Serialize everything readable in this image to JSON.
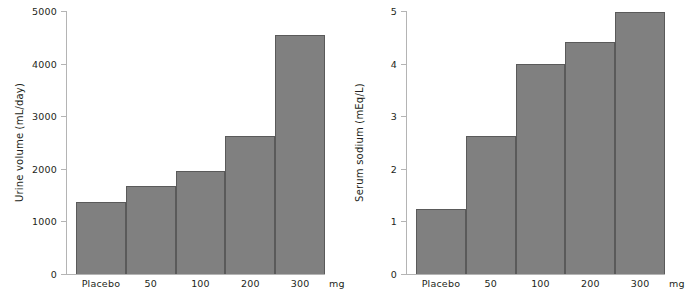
{
  "figure": {
    "background": "#ffffff",
    "bar_fill": "#808080",
    "bar_stroke": "#5a5a5a",
    "axis_color": "#b4b4b4",
    "text_color": "#231f20"
  },
  "panels": [
    {
      "id": "urine-volume",
      "ylabel": "Urine volume (mL/day)",
      "unit_label": "mg",
      "yticks": [
        "0",
        "1000",
        "2000",
        "3000",
        "4000",
        "5000"
      ],
      "categories": [
        "Placebo",
        "50",
        "100",
        "200",
        "300"
      ],
      "values": [
        1370,
        1670,
        1960,
        2620,
        4550
      ]
    },
    {
      "id": "serum-sodium",
      "ylabel": "Serum sodium (mEq/L)",
      "unit_label": "mg",
      "yticks": [
        "0",
        "1",
        "2",
        "3",
        "4",
        "5"
      ],
      "categories": [
        "Placebo",
        "50",
        "100",
        "200",
        "300"
      ],
      "values": [
        1.24,
        2.63,
        4.0,
        4.42,
        4.98
      ]
    }
  ],
  "chart_data": [
    {
      "type": "bar",
      "title": "",
      "xlabel": "mg",
      "ylabel": "Urine volume (mL/day)",
      "categories": [
        "Placebo",
        "50",
        "100",
        "200",
        "300"
      ],
      "values": [
        1370,
        1670,
        1960,
        2620,
        4550
      ],
      "ylim": [
        0,
        5000
      ],
      "ytick_values": [
        0,
        1000,
        2000,
        3000,
        4000,
        5000
      ],
      "grid": false,
      "legend": "none",
      "bar_color": "#808080"
    },
    {
      "type": "bar",
      "title": "",
      "xlabel": "mg",
      "ylabel": "Serum sodium (mEq/L)",
      "categories": [
        "Placebo",
        "50",
        "100",
        "200",
        "300"
      ],
      "values": [
        1.24,
        2.63,
        4.0,
        4.42,
        4.98
      ],
      "ylim": [
        0,
        5
      ],
      "ytick_values": [
        0,
        1,
        2,
        3,
        4,
        5
      ],
      "grid": false,
      "legend": "none",
      "bar_color": "#808080"
    }
  ]
}
